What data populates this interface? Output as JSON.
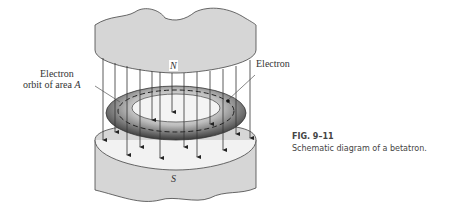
{
  "figure": {
    "number": "FIG. 9–11",
    "caption": "Schematic diagram of a betatron."
  },
  "labels": {
    "north_pole": "N",
    "south_pole": "S",
    "electron": "Electron",
    "orbit_line1": "Electron",
    "orbit_line2": "orbit of area",
    "orbit_area_symbol": "A"
  },
  "colors": {
    "pole_fill": "#d6d6d6",
    "line": "#333333",
    "caption_text": "#444444"
  }
}
